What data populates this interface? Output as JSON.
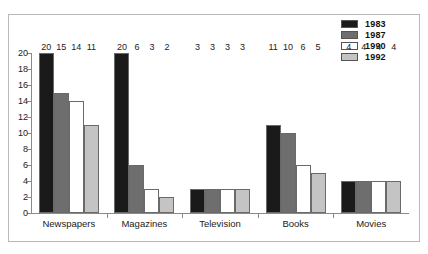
{
  "chart_data": {
    "type": "bar",
    "title": "",
    "xlabel": "",
    "ylabel": "",
    "ylim": [
      0,
      20
    ],
    "ytick_step": 2,
    "grid": false,
    "legend_position": "top-right",
    "categories": [
      "Newspapers",
      "Magazines",
      "Television",
      "Books",
      "Movies"
    ],
    "yticks": [
      "20",
      "18",
      "16",
      "14",
      "12",
      "10",
      "8",
      "6",
      "4",
      "2",
      "0"
    ],
    "series": [
      {
        "name": "1983",
        "color": "#1a1a1a",
        "values": [
          20,
          20,
          3,
          11,
          4
        ]
      },
      {
        "name": "1987",
        "color": "#6e6e6e",
        "values": [
          15,
          6,
          3,
          10,
          4
        ]
      },
      {
        "name": "1990",
        "color": "#ffffff",
        "values": [
          14,
          3,
          3,
          6,
          4
        ]
      },
      {
        "name": "1992",
        "color": "#c4c4c4",
        "values": [
          11,
          2,
          3,
          5,
          4
        ]
      }
    ]
  },
  "legend": {
    "items": [
      {
        "label": "1983",
        "color": "#1a1a1a"
      },
      {
        "label": "1987",
        "color": "#6e6e6e"
      },
      {
        "label": "1990",
        "color": "#ffffff"
      },
      {
        "label": "1992",
        "color": "#c4c4c4"
      }
    ]
  }
}
